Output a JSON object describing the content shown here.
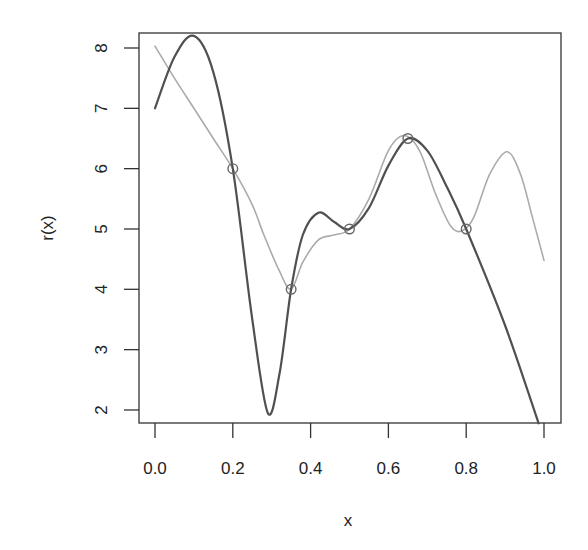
{
  "chart_data": {
    "type": "line",
    "title": "",
    "xlabel": "x",
    "ylabel": "r(x)",
    "xlim": [
      0.0,
      1.0
    ],
    "ylim": [
      2,
      8
    ],
    "grid": false,
    "legend": null,
    "x_ticks": [
      "0.0",
      "0.2",
      "0.4",
      "0.6",
      "0.8",
      "1.0"
    ],
    "y_ticks": [
      "2",
      "3",
      "4",
      "5",
      "6",
      "7",
      "8"
    ],
    "points": {
      "marker": "open-circle",
      "x": [
        0.2,
        0.35,
        0.5,
        0.65,
        0.8
      ],
      "y": [
        6,
        4,
        5,
        6.5,
        5
      ]
    },
    "series": [
      {
        "name": "dark-curve",
        "color": "#505050",
        "x": [
          0,
          0.05,
          0.1,
          0.15,
          0.2,
          0.25,
          0.29,
          0.32,
          0.35,
          0.38,
          0.42,
          0.46,
          0.5,
          0.55,
          0.6,
          0.65,
          0.7,
          0.75,
          0.8,
          0.9,
          0.986
        ],
        "y": [
          7.0,
          7.85,
          8.2,
          7.6,
          6.0,
          3.5,
          1.95,
          2.6,
          4.0,
          4.9,
          5.27,
          5.12,
          5.0,
          5.35,
          6.05,
          6.5,
          6.3,
          5.7,
          5.0,
          3.4,
          1.78
        ]
      },
      {
        "name": "light-curve",
        "color": "#ababab",
        "x": [
          0,
          0.05,
          0.1,
          0.15,
          0.2,
          0.25,
          0.28,
          0.32,
          0.35,
          0.38,
          0.42,
          0.46,
          0.5,
          0.55,
          0.6,
          0.64,
          0.68,
          0.72,
          0.76,
          0.79,
          0.82,
          0.86,
          0.905,
          0.94,
          0.97,
          1.0
        ],
        "y": [
          8.03,
          7.5,
          7.0,
          6.5,
          6.0,
          5.4,
          4.9,
          4.3,
          4.0,
          4.45,
          4.82,
          4.9,
          5.0,
          5.5,
          6.3,
          6.55,
          6.3,
          5.6,
          5.05,
          4.97,
          5.2,
          5.9,
          6.28,
          5.9,
          5.2,
          4.48
        ]
      }
    ]
  },
  "colors": {
    "frame": "#333333",
    "marker": "#666666",
    "background": "#ffffff"
  }
}
